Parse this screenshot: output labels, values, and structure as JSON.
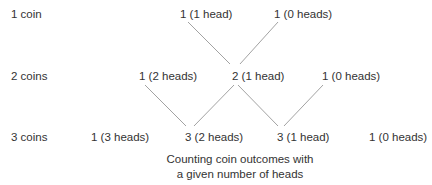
{
  "rows": [
    {
      "label": "1 coin",
      "nodes": [
        "1 (1 head)",
        "1 (0 heads)"
      ]
    },
    {
      "label": "2 coins",
      "nodes": [
        "1 (2 heads)",
        "2 (1 head)",
        "1 (0 heads)"
      ]
    },
    {
      "label": "3 coins",
      "nodes": [
        "1 (3 heads)",
        "3 (2 heads)",
        "3 (1 head)",
        "1 (0 heads)"
      ]
    }
  ],
  "caption": {
    "line1": "Counting coin outcomes with",
    "line2": "a given number of heads"
  },
  "colors": {
    "text": "#333333",
    "line": "#888888"
  }
}
